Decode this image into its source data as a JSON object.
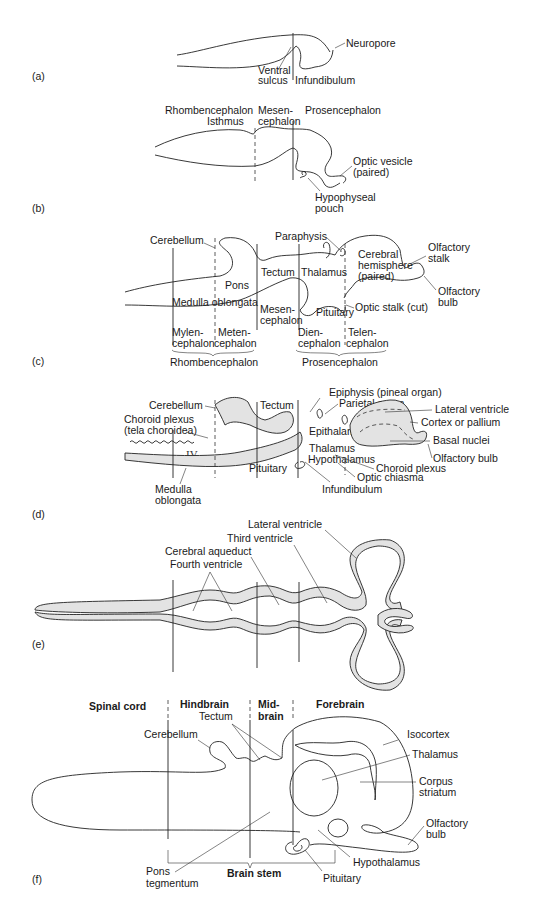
{
  "panels": {
    "a": {
      "tag": "(a)",
      "labels": {
        "neuropore": "Neuropore",
        "ventral_sulcus_1": "Ventral",
        "ventral_sulcus_2": "sulcus",
        "infundibulum": "Infundibulum"
      }
    },
    "b": {
      "tag": "(b)",
      "labels": {
        "rhombencephalon": "Rhombencephalon",
        "isthmus": "Isthmus",
        "mesencephalon_1": "Mesen-",
        "mesencephalon_2": "cephalon",
        "prosencephalon": "Prosencephalon",
        "optic_vesicle_1": "Optic vesicle",
        "optic_vesicle_2": "(paired)",
        "hypophyseal_1": "Hypophyseal",
        "hypophyseal_2": "pouch"
      }
    },
    "c": {
      "tag": "(c)",
      "labels": {
        "cerebellum": "Cerebellum",
        "paraphysis": "Paraphysis",
        "olfactory_stalk_1": "Olfactory",
        "olfactory_stalk_2": "stalk",
        "cerebral_hemisphere_1": "Cerebral",
        "cerebral_hemisphere_2": "hemisphere",
        "cerebral_hemisphere_3": "(paired)",
        "tectum": "Tectum",
        "thalamus": "Thalamus",
        "pons": "Pons",
        "olfactory_bulb_1": "Olfactory",
        "olfactory_bulb_2": "bulb",
        "medulla_oblongata": "Medulla oblongata",
        "optic_stalk": "Optic stalk (cut)",
        "mesencephalon_1": "Mesen-",
        "mesencephalon_2": "cephalon",
        "pituitary": "Pituitary",
        "myelencephalon_1": "Mylen-",
        "myelencephalon_2": "cephalon",
        "metencephalon_1": "Meten-",
        "metencephalon_2": "cephalon",
        "diencephalon_1": "Dien-",
        "diencephalon_2": "cephalon",
        "telencephalon_1": "Telen-",
        "telencephalon_2": "cephalon",
        "rhombencephalon": "Rhombencephalon",
        "prosencephalon": "Prosencephalon"
      }
    },
    "d": {
      "tag": "(d)",
      "labels": {
        "epiphysis": "Epiphysis (pineal organ)",
        "cerebellum": "Cerebellum",
        "tectum": "Tectum",
        "parietal_organ": "Parietal organ",
        "lateral_ventricle": "Lateral ventricle",
        "choroid_plexus_1": "Choroid plexus",
        "choroid_plexus_2": "(tela choroidea)",
        "cortex": "Cortex or pallium",
        "epithalamus": "Epithalamus",
        "basal_nuclei": "Basal nuclei",
        "fourth_ventricle_roman": "IV",
        "thalamus": "Thalamus",
        "olfactory_bulb": "Olfactory bulb",
        "hypothalamus": "Hypothalamus",
        "choroid_plexus_b": "Choroid plexus",
        "pituitary": "Pituitary",
        "optic_chiasma": "Optic chiasma",
        "infundibulum": "Infundibulum",
        "medulla_1": "Medulla",
        "medulla_2": "oblongata"
      }
    },
    "e": {
      "tag": "(e)",
      "labels": {
        "lateral_ventricle": "Lateral ventricle",
        "third_ventricle": "Third ventricle",
        "cerebral_aqueduct": "Cerebral aqueduct",
        "fourth_ventricle": "Fourth ventricle"
      }
    },
    "f": {
      "tag": "(f)",
      "headers": {
        "spinal_cord": "Spinal cord",
        "hindbrain": "Hindbrain",
        "midbrain_1": "Mid-",
        "midbrain_2": "brain",
        "forebrain": "Forebrain"
      },
      "labels": {
        "tectum": "Tectum",
        "cerebellum": "Cerebellum",
        "isocortex": "Isocortex",
        "thalamus": "Thalamus",
        "corpus_striatum_1": "Corpus",
        "corpus_striatum_2": "striatum",
        "olfactory_bulb_1": "Olfactory",
        "olfactory_bulb_2": "bulb",
        "hypothalamus": "Hypothalamus",
        "pons_1": "Pons",
        "pons_2": "tegmentum",
        "brain_stem": "Brain stem",
        "pituitary": "Pituitary"
      }
    }
  },
  "colors": {
    "line": "#222222",
    "fill": "#e3e3e3",
    "background": "#ffffff"
  }
}
